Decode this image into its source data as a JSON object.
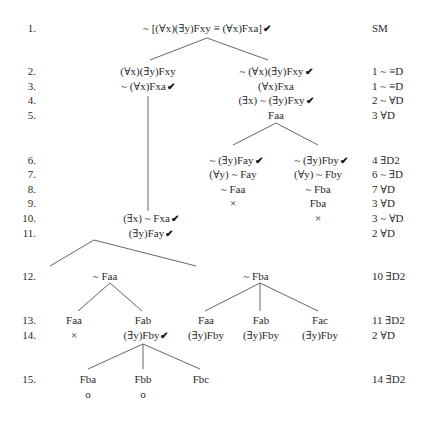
{
  "line_numbers": [
    "1.",
    "2.",
    "3.",
    "4.",
    "5.",
    "6.",
    "7.",
    "8.",
    "9.",
    "10.",
    "11.",
    "12.",
    "13.",
    "14.",
    "15."
  ],
  "justifications": {
    "r1": "SM",
    "r2": "1 ~ ≡D",
    "r3": "1 ~ ≡D",
    "r4": "2 ~ ∀D",
    "r5": "3 ∀D",
    "r6": "4 ∃D2",
    "r7": "6 ~ ∃D",
    "r8": "7 ∀D",
    "r9": "3 ∀D",
    "r10": "3 ~ ∀D",
    "r11": "2 ∀D",
    "r12": "10 ∃D2",
    "r13": "11 ∃D2",
    "r14": "2 ∀D",
    "r15": "14 ∃D2"
  },
  "nodes": {
    "root": "~ [(∀x)(∃y)Fxy ≡ (∀x)Fxa]",
    "l2": "(∀x)(∃y)Fxy",
    "l3": "~ (∀x)Fxa",
    "r2": "~ (∀x)(∃y)Fxy",
    "r3": "(∀x)Fxa",
    "r4": "(∃x) ~ (∃y)Fxy",
    "r5": "Faa",
    "rl6": "~ (∃y)Fay",
    "rl7": "(∀y) ~ Fay",
    "rl8": "~ Faa",
    "rl9": "×",
    "rr6": "~ (∃y)Fby",
    "rr7": "(∀y) ~ Fby",
    "rr8": "~ Fba",
    "rr9": "Fba",
    "rr10": "×",
    "l10": "(∃x) ~ Fxa",
    "l11": "(∃y)Fay",
    "a12": "~ Faa",
    "b12": "~ Fba",
    "a13a": "Faa",
    "a14a": "×",
    "a13b": "Fab",
    "a14b": "(∃y)Fby",
    "b13a": "Faa",
    "b14a": "(∃y)Fby",
    "b13b": "Fab",
    "b14b": "(∃y)Fby",
    "b13c": "Fac",
    "b14c": "(∃y)Fby",
    "c15a": "Fba",
    "c16a": "o",
    "c15b": "Fbb",
    "c16b": "o",
    "c15c": "Fbc"
  },
  "check_mark": "✔",
  "colors": {
    "text": "#2a2a2a",
    "lines": "#555555",
    "background": "#ffffff"
  }
}
